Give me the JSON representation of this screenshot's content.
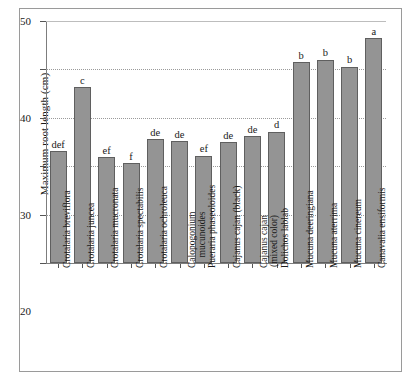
{
  "chart_data": {
    "type": "bar",
    "title": "",
    "xlabel": "",
    "ylabel": "Maximum root length (cm)",
    "ylim": [
      0,
      50
    ],
    "yticks": [
      0,
      10,
      20,
      30,
      40,
      50
    ],
    "grid": "horizontal-dotted",
    "legend": "none",
    "bar_color": "#949494",
    "bar_edge_color": "#5f5f5f",
    "categories": [
      "Crotalaria breviflora",
      "Crotalaria juncea",
      "Crotalaria mucronata",
      "Crotalaria spectabilis",
      "Crotalaria ochroleuca",
      "Calopogonium mucunoides",
      "Pueraria phaseoloides",
      "Cajanus cajan (black)",
      "Cajanus cajan (mixed color)",
      "Dolichos lablab",
      "Mucuna deeringiana",
      "Mucuna aterrima",
      "Mucuna cinereum",
      "Canavalia ensiformis"
    ],
    "category_lines": [
      [
        "Crotalaria breviflora",
        ""
      ],
      [
        "Crotalaria juncea",
        ""
      ],
      [
        "Crotalaria mucronata",
        ""
      ],
      [
        "Crotalaria spectabilis",
        ""
      ],
      [
        "Crotalaria ochroleuca",
        ""
      ],
      [
        "Calopogonium",
        "mucunoides"
      ],
      [
        "Pueraria phaseoloides",
        ""
      ],
      [
        "Cajanus cajan (black)",
        ""
      ],
      [
        "Cajanus cajan",
        "(mixed color)"
      ],
      [
        "Dolichos lablab",
        ""
      ],
      [
        "Mucuna deeringiana",
        ""
      ],
      [
        "Mucuna aterrima",
        ""
      ],
      [
        "Mucuna cinereum",
        ""
      ],
      [
        "Canavalia ensiformis",
        ""
      ]
    ],
    "values": [
      23.1,
      36.3,
      21.9,
      20.6,
      25.6,
      25.2,
      22.2,
      24.9,
      26.2,
      27.1,
      41.5,
      42.0,
      40.6,
      46.4
    ],
    "annotations": [
      "def",
      "c",
      "ef",
      "f",
      "de",
      "de",
      "ef",
      "de",
      "de",
      "d",
      "b",
      "b",
      "b",
      "a"
    ]
  }
}
